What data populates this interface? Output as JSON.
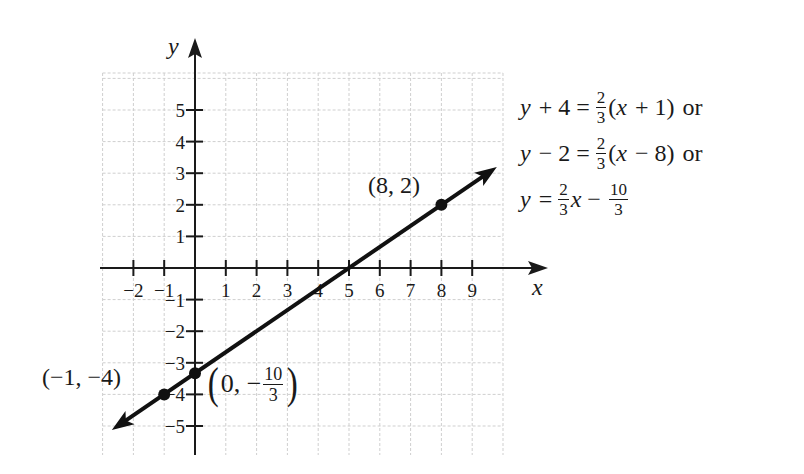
{
  "chart_data": {
    "type": "line",
    "title": "",
    "xlabel": "x",
    "ylabel": "y",
    "xlim": [
      -3,
      10
    ],
    "ylim": [
      -6,
      6
    ],
    "grid": true,
    "x_ticks": [
      -2,
      -1,
      1,
      2,
      3,
      4,
      5,
      6,
      7,
      8,
      9
    ],
    "y_ticks": [
      -5,
      -4,
      -3,
      -2,
      -1,
      1,
      2,
      3,
      4,
      5
    ],
    "x_tick_labels": [
      "−2",
      "−1",
      "1",
      "2",
      "3",
      "4",
      "5",
      "6",
      "7",
      "8",
      "9"
    ],
    "y_tick_labels": [
      "−5",
      "−4",
      "−3",
      "−2",
      "−1",
      "1",
      "2",
      "3",
      "4",
      "5"
    ],
    "series": [
      {
        "name": "y = (2/3)x − 10/3",
        "slope": 0.6667,
        "intercept": -3.3333,
        "x": [
          -2.7,
          9.8
        ],
        "y": [
          -5.13,
          3.2
        ],
        "arrows": "both"
      }
    ],
    "points": [
      {
        "x": -1,
        "y": -4,
        "label": "(−1, −4)"
      },
      {
        "x": 0,
        "y": -3.3333,
        "label": "(0, −10/3)"
      },
      {
        "x": 8,
        "y": 2,
        "label": "(8, 2)"
      }
    ],
    "annotations": [
      "y + 4 = (2/3)(x + 1) or",
      "y − 2 = (2/3)(x − 8) or",
      "y = (2/3)x − 10/3"
    ]
  },
  "labels": {
    "x_axis": "x",
    "y_axis": "y",
    "point_a": "(−1, −4)",
    "point_b_prefix": "0, −",
    "point_b_num": "10",
    "point_b_den": "3",
    "point_c": "(8, 2)"
  },
  "equations": {
    "eq1": {
      "lhs_var": "y",
      "lhs_rest": "+ 4 =",
      "num": "2",
      "den": "3",
      "rhs_open": "(",
      "rhs_var": "x",
      "rhs_rest": "+ 1)",
      "suffix": "or"
    },
    "eq2": {
      "lhs_var": "y",
      "lhs_rest": "− 2 =",
      "num": "2",
      "den": "3",
      "rhs_open": "(",
      "rhs_var": "x",
      "rhs_rest": "− 8)",
      "suffix": "or"
    },
    "eq3": {
      "lhs_var": "y",
      "lhs_rest": "=",
      "num": "2",
      "den": "3",
      "rhs_var": "x",
      "minus": "−",
      "num2": "10",
      "den2": "3"
    }
  }
}
